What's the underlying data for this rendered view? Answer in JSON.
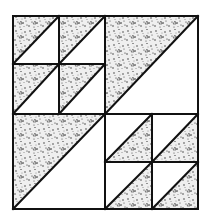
{
  "diagram": {
    "type": "quilt-block",
    "colors": {
      "background": "#ffffff",
      "line": "#111111",
      "fabric_base": "#f2f2f2",
      "fabric_speckle": "#222222"
    },
    "bounds": {
      "x0": 13,
      "y0": 16,
      "x1": 198,
      "y1": 209
    },
    "center": {
      "x": 105,
      "y": 114
    },
    "quadrants": [
      {
        "name": "top-left",
        "kind": "four-patch",
        "cross": {
          "x": 59,
          "y": 64
        },
        "shaded": "upper-left"
      },
      {
        "name": "top-right",
        "kind": "single-hst",
        "shaded": "upper-left"
      },
      {
        "name": "bottom-left",
        "kind": "single-hst",
        "shaded": "upper-left"
      },
      {
        "name": "bottom-right",
        "kind": "four-patch",
        "cross": {
          "x": 152,
          "y": 162
        },
        "shaded": "lower-right"
      }
    ]
  }
}
